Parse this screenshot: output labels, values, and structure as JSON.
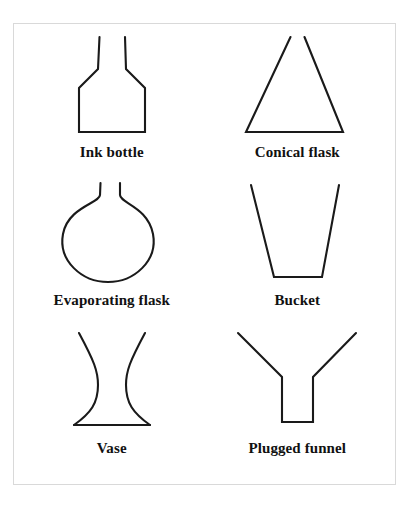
{
  "figure": {
    "background_color": "#ffffff",
    "frame_color": "#d9d9d9",
    "stroke_color": "#1a1a1a",
    "columns": 2,
    "rows": 3,
    "items": [
      {
        "label": "Ink bottle",
        "shape": "ink-bottle",
        "description": "Open-necked bottle: two short vertical neck lines at top, sloping shoulders outward to a rectangular body with a flat base."
      },
      {
        "label": "Conical flask",
        "shape": "conical-flask",
        "description": "Triangle open at the apex: two sides sloping outward and down from a narrow gap at top to a wide flat base."
      },
      {
        "label": "Evaporating flask",
        "shape": "evaporating-flask",
        "description": "Round-bottom flask: two short vertical neck lines flaring outward into a large circular bulb."
      },
      {
        "label": "Bucket",
        "shape": "bucket",
        "description": "Trapezoid open at the top: wide mouth narrowing downward to a narrow flat base."
      },
      {
        "label": "Vase",
        "shape": "vase",
        "description": "Hourglass profile: concave curves wide at the top, pinched at the waist, flaring out to a wide flat base."
      },
      {
        "label": "Plugged funnel",
        "shape": "plugged-funnel",
        "description": "Y shape: wide V-shaped cone at top meeting a narrow vertical stem closed by a flat plug at the bottom."
      }
    ]
  }
}
